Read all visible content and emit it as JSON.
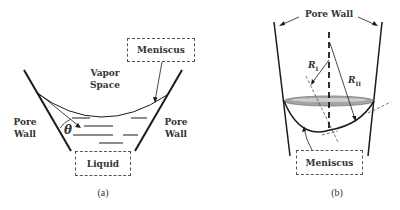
{
  "figure": {
    "panel_a": {
      "caption": "(a)",
      "meniscus_label": "Meniscus",
      "vapor_space_line1": "Vapor",
      "vapor_space_line2": "Space",
      "pore_wall_left_line1": "Pore",
      "pore_wall_left_line2": "Wall",
      "pore_wall_right_line1": "Pore",
      "pore_wall_right_line2": "Wall",
      "liquid_label": "Liquid",
      "angle_symbol": "θ"
    },
    "panel_b": {
      "caption": "(b)",
      "pore_wall_label": "Pore Wall",
      "meniscus_label": "Meniscus",
      "radius_1_symbol": "R",
      "radius_1_sub": "I",
      "radius_2_symbol": "R",
      "radius_2_sub": "II"
    }
  },
  "colors": {
    "line": "#1a1a1a",
    "text": "#333333",
    "lens_fill": "#9a9a9a",
    "dashed_box": "#555555"
  }
}
